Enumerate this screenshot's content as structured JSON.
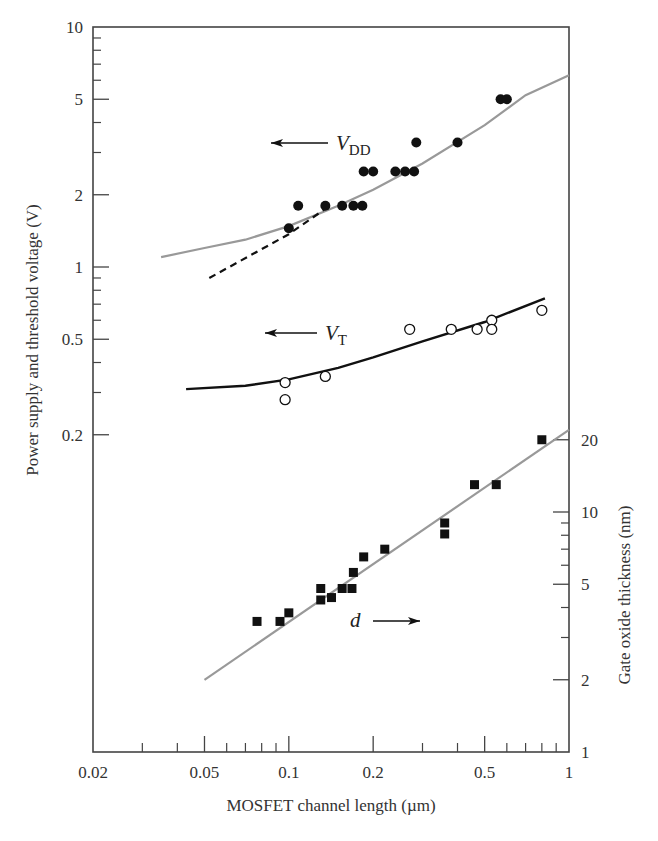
{
  "chart_data": {
    "type": "scatter",
    "title": "",
    "xlabel": "MOSFET channel length (µm)",
    "ylabel": "Power supply and threshold voltage (V)",
    "ylabel_right": "Gate oxide thickness (nm)",
    "x_scale": "log",
    "y_scale": "log",
    "xlim": [
      0.02,
      1
    ],
    "ylim": [
      0.0095,
      10
    ],
    "ylim_right": [
      1,
      104
    ],
    "grid": false,
    "x_ticks": [
      0.02,
      0.05,
      0.1,
      0.2,
      0.5,
      1
    ],
    "x_tick_labels": [
      "0.02",
      "0.05",
      "0.1",
      "0.2",
      "0.5",
      "1"
    ],
    "y_ticks": [
      10,
      5,
      2,
      1,
      0.5,
      0.2
    ],
    "y_tick_labels": [
      "10",
      "5",
      "2",
      "1",
      "0.5",
      "0.2"
    ],
    "y_right_ticks": [
      20,
      10,
      5,
      2,
      1
    ],
    "y_right_tick_labels": [
      "20",
      "10",
      "5",
      "2",
      "1"
    ],
    "annotations": [
      {
        "text": "V",
        "sub": "DD",
        "arrow": "left"
      },
      {
        "text": "V",
        "sub": "T",
        "arrow": "left"
      },
      {
        "text": "d",
        "sub": "",
        "arrow": "right"
      }
    ],
    "series": [
      {
        "name": "VDD",
        "axis": "left",
        "marker": "filled-circle",
        "points": [
          [
            0.1,
            1.45
          ],
          [
            0.108,
            1.8
          ],
          [
            0.135,
            1.8
          ],
          [
            0.155,
            1.8
          ],
          [
            0.17,
            1.8
          ],
          [
            0.183,
            1.8
          ],
          [
            0.185,
            2.5
          ],
          [
            0.2,
            2.5
          ],
          [
            0.24,
            2.5
          ],
          [
            0.26,
            2.5
          ],
          [
            0.28,
            2.5
          ],
          [
            0.285,
            3.3
          ],
          [
            0.4,
            3.3
          ],
          [
            0.57,
            5.0
          ],
          [
            0.6,
            5.0
          ]
        ],
        "fit_line": {
          "style": "solid-gray",
          "points": [
            [
              0.035,
              1.1
            ],
            [
              0.05,
              1.2
            ],
            [
              0.07,
              1.3
            ],
            [
              0.1,
              1.48
            ],
            [
              0.15,
              1.8
            ],
            [
              0.2,
              2.1
            ],
            [
              0.3,
              2.7
            ],
            [
              0.5,
              3.9
            ],
            [
              0.7,
              5.2
            ],
            [
              1.0,
              6.3
            ]
          ]
        },
        "extrap_line": {
          "style": "dashed-black",
          "points": [
            [
              0.052,
              0.9
            ],
            [
              0.1,
              1.37
            ],
            [
              0.14,
              1.8
            ]
          ]
        }
      },
      {
        "name": "VT",
        "axis": "left",
        "marker": "open-circle",
        "points": [
          [
            0.097,
            0.33
          ],
          [
            0.097,
            0.28
          ],
          [
            0.135,
            0.35
          ],
          [
            0.27,
            0.55
          ],
          [
            0.38,
            0.55
          ],
          [
            0.47,
            0.55
          ],
          [
            0.53,
            0.6
          ],
          [
            0.53,
            0.55
          ],
          [
            0.8,
            0.66
          ]
        ],
        "fit_line": {
          "style": "solid-black",
          "points": [
            [
              0.043,
              0.31
            ],
            [
              0.07,
              0.32
            ],
            [
              0.1,
              0.34
            ],
            [
              0.15,
              0.38
            ],
            [
              0.2,
              0.42
            ],
            [
              0.3,
              0.49
            ],
            [
              0.5,
              0.59
            ],
            [
              0.82,
              0.74
            ]
          ]
        }
      },
      {
        "name": "d (gate oxide thickness, nm)",
        "axis": "right",
        "marker": "filled-square",
        "points": [
          [
            0.077,
            3.5
          ],
          [
            0.093,
            3.5
          ],
          [
            0.1,
            3.8
          ],
          [
            0.13,
            4.8
          ],
          [
            0.13,
            4.3
          ],
          [
            0.142,
            4.4
          ],
          [
            0.155,
            4.8
          ],
          [
            0.168,
            4.8
          ],
          [
            0.17,
            5.6
          ],
          [
            0.185,
            6.5
          ],
          [
            0.22,
            7.0
          ],
          [
            0.36,
            9.0
          ],
          [
            0.36,
            8.1
          ],
          [
            0.46,
            13.0
          ],
          [
            0.55,
            13.0
          ],
          [
            0.8,
            20.0
          ]
        ],
        "fit_line": {
          "style": "solid-gray",
          "points": [
            [
              0.05,
              2.0
            ],
            [
              1.0,
              22.0
            ]
          ]
        }
      }
    ]
  }
}
